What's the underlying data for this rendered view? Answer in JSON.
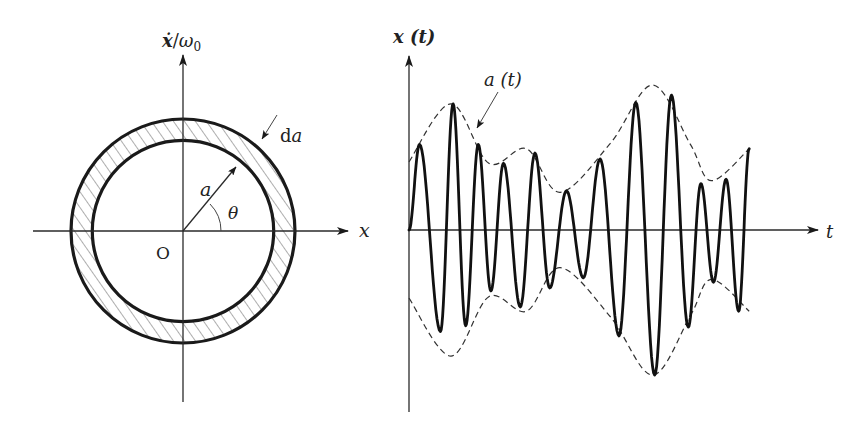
{
  "left_panel": {
    "title": "Phase plane",
    "y_axis_label_var": "ẋ",
    "y_axis_label_sep": "/",
    "y_axis_label_omega": "ω",
    "y_axis_label_sub": "0",
    "x_axis_label": "x",
    "origin_label": "O",
    "radius_label": "a",
    "angle_label": "θ",
    "ring_width_label_d": "d",
    "ring_width_label_a": "a",
    "ring_inner_radius_ratio": 0.81
  },
  "right_panel": {
    "title": "Signal with slowly varying amplitude",
    "y_axis_label": "x (t)",
    "x_axis_label": "t",
    "envelope_label": "a (t)",
    "chart_data": {
      "type": "line",
      "title": "",
      "xlabel": "t",
      "ylabel": "x(t)",
      "grid": false,
      "series": [
        {
          "name": "x(t)",
          "style": "solid-thick",
          "extrema": [
            {
              "t": 0.0,
              "x": 0.0
            },
            {
              "t": 0.025,
              "x": 0.59
            },
            {
              "t": 0.075,
              "x": -0.7
            },
            {
              "t": 0.105,
              "x": 0.87
            },
            {
              "t": 0.135,
              "x": -0.66
            },
            {
              "t": 0.165,
              "x": 0.59
            },
            {
              "t": 0.195,
              "x": -0.42
            },
            {
              "t": 0.225,
              "x": 0.46
            },
            {
              "t": 0.265,
              "x": -0.53
            },
            {
              "t": 0.3,
              "x": 0.53
            },
            {
              "t": 0.335,
              "x": -0.4
            },
            {
              "t": 0.375,
              "x": 0.27
            },
            {
              "t": 0.415,
              "x": -0.33
            },
            {
              "t": 0.455,
              "x": 0.49
            },
            {
              "t": 0.5,
              "x": -0.73
            },
            {
              "t": 0.54,
              "x": 0.88
            },
            {
              "t": 0.585,
              "x": -1.0
            },
            {
              "t": 0.625,
              "x": 0.93
            },
            {
              "t": 0.665,
              "x": -0.67
            },
            {
              "t": 0.695,
              "x": 0.32
            },
            {
              "t": 0.725,
              "x": -0.36
            },
            {
              "t": 0.755,
              "x": 0.35
            },
            {
              "t": 0.785,
              "x": -0.56
            },
            {
              "t": 0.81,
              "x": 0.56
            }
          ]
        },
        {
          "name": "a(t)",
          "style": "dashed",
          "points": [
            {
              "t": 0.0,
              "a": 0.47
            },
            {
              "t": 0.1,
              "a": 0.87
            },
            {
              "t": 0.19,
              "a": 0.46
            },
            {
              "t": 0.28,
              "a": 0.56
            },
            {
              "t": 0.36,
              "a": 0.26
            },
            {
              "t": 0.48,
              "a": 0.6
            },
            {
              "t": 0.58,
              "a": 1.0
            },
            {
              "t": 0.67,
              "a": 0.59
            },
            {
              "t": 0.72,
              "a": 0.34
            },
            {
              "t": 0.81,
              "a": 0.56
            }
          ]
        }
      ]
    }
  }
}
